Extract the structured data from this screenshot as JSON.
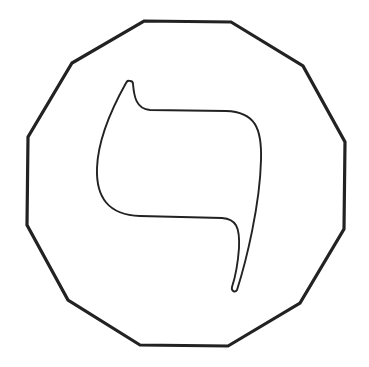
{
  "figure": {
    "glyph_label": "Kaf",
    "glyph_char": "כ",
    "stroke_color": "#222222",
    "background_color": "#ffffff",
    "frame_shape": "dodecagon",
    "frame_vertices": [
      [
        144,
        21
      ],
      [
        231,
        22
      ],
      [
        303,
        66
      ],
      [
        345,
        142
      ],
      [
        344,
        229
      ],
      [
        300,
        303
      ],
      [
        228,
        346
      ],
      [
        140,
        345
      ],
      [
        68,
        300
      ],
      [
        27,
        225
      ],
      [
        28,
        137
      ],
      [
        72,
        63
      ]
    ]
  }
}
